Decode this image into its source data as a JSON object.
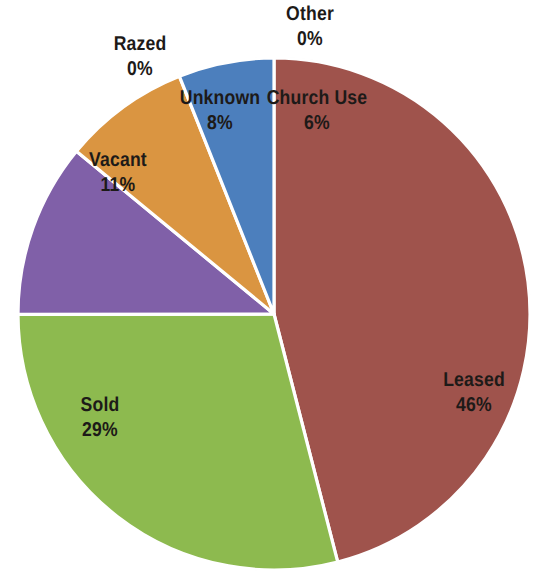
{
  "chart_data": {
    "type": "pie",
    "title": "",
    "subtitle": "",
    "xlabel": "",
    "ylabel": "",
    "legend_position": "none",
    "labels_inside_and_outside": true,
    "categories": [
      "Leased",
      "Sold",
      "Vacant",
      "Razed",
      "Unknown",
      "Other",
      "Church Use"
    ],
    "values": [
      46,
      29,
      11,
      0,
      8,
      0,
      6
    ],
    "value_unit": "%",
    "colors": [
      "#9F534C",
      "#8DBA4F",
      "#8060A8",
      "#8060A8",
      "#DA9541",
      "#DA9541",
      "#4C7FBD"
    ],
    "slices": [
      {
        "label": "Leased",
        "percent": 46,
        "percent_text": "46%",
        "color": "#9F534C",
        "start_angle_deg": 0,
        "end_angle_deg": 165.6
      },
      {
        "label": "Sold",
        "percent": 29,
        "percent_text": "29%",
        "color": "#8DBA4F",
        "start_angle_deg": 165.6,
        "end_angle_deg": 269.9
      },
      {
        "label": "Vacant",
        "percent": 11,
        "percent_text": "11%",
        "color": "#8060A8",
        "start_angle_deg": 269.9,
        "end_angle_deg": 309.5
      },
      {
        "label": "Razed",
        "percent": 0,
        "percent_text": "0%",
        "color": "#8060A8",
        "start_angle_deg": 309.5,
        "end_angle_deg": 309.5
      },
      {
        "label": "Unknown",
        "percent": 8,
        "percent_text": "8%",
        "color": "#DA9541",
        "start_angle_deg": 309.5,
        "end_angle_deg": 338.3
      },
      {
        "label": "Other",
        "percent": 0,
        "percent_text": "0%",
        "color": "#DA9541",
        "start_angle_deg": 338.3,
        "end_angle_deg": 338.3
      },
      {
        "label": "Church Use",
        "percent": 6,
        "percent_text": "6%",
        "color": "#4C7FBD",
        "start_angle_deg": 338.3,
        "end_angle_deg": 360
      }
    ],
    "background_color": "#FFFFFF",
    "slice_border_color": "#FFFFFF",
    "label_text_color": "#1D1A18"
  },
  "labels": {
    "other": {
      "name": "Other",
      "pct": "0%"
    },
    "razed": {
      "name": "Razed",
      "pct": "0%"
    },
    "unknown": {
      "name": "Unknown",
      "pct": "8%"
    },
    "church_use": {
      "name": "Church Use",
      "pct": "6%"
    },
    "vacant": {
      "name": "Vacant",
      "pct": "11%"
    },
    "sold": {
      "name": "Sold",
      "pct": "29%"
    },
    "leased": {
      "name": "Leased",
      "pct": "46%"
    }
  }
}
